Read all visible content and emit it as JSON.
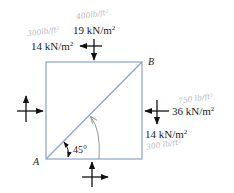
{
  "diagram": {
    "type": "stress-element",
    "element_shape": "square",
    "points": {
      "A": "A",
      "B": "B"
    },
    "angle_label": "45°",
    "stresses": {
      "top_normal": "19 kN/m",
      "top_normal_sup": "2",
      "top_shear": "14 kN/m",
      "top_shear_sup": "2",
      "right_normal": "36 kN/m",
      "right_normal_sup": "2",
      "right_shear": "14 kN/m",
      "right_shear_sup": "2"
    },
    "handwritten_notes": {
      "top_normal": "400lb/ft²",
      "top_shear": "300lb/ft²",
      "right_normal": "750 lb/ft²",
      "right_shear": "300 lb/ft²"
    },
    "colors": {
      "element_edge": "#8aa3c8",
      "arrow": "#111111",
      "handwriting": "#b8b8c4"
    }
  }
}
